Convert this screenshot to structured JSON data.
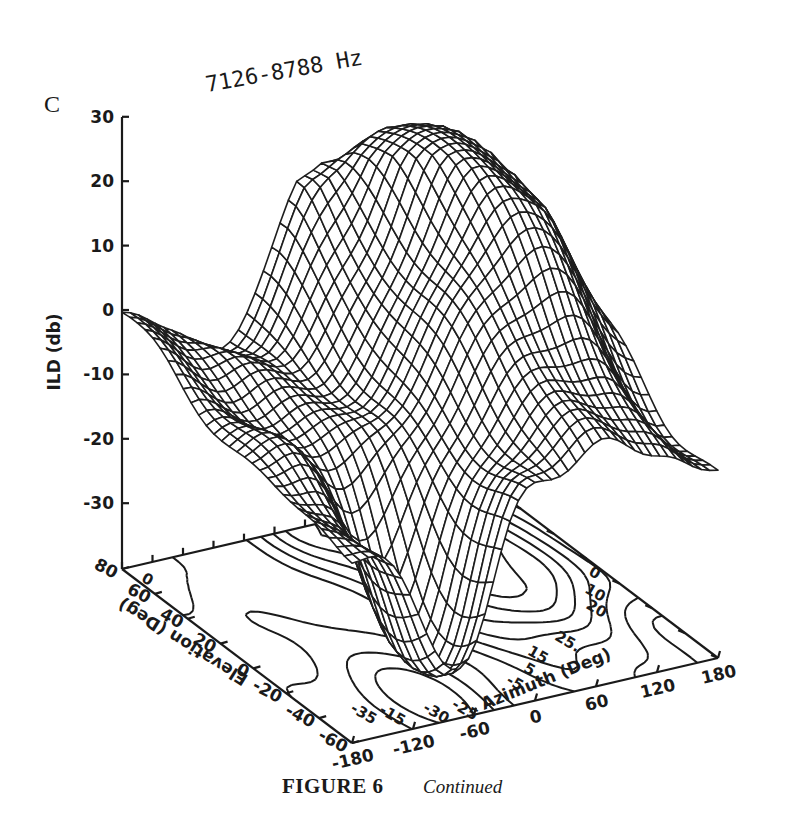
{
  "figure": {
    "panel_letter": "C",
    "caption_label": "FIGURE 6",
    "caption_text": "Continued"
  },
  "chart_data": {
    "type": "surface3d",
    "title": "7126-8788 Hz",
    "zlabel": "ILD (db)",
    "xlabel": "Azimuth (Deg)",
    "ylabel": "Elevation (Deg)",
    "zlim": [
      -38,
      30
    ],
    "xlim": [
      -180,
      180
    ],
    "ylim": [
      -60,
      80
    ],
    "z_ticks": [
      "30",
      "20",
      "10",
      "0",
      "-10",
      "-20",
      "-30"
    ],
    "z_tick_values": [
      30,
      20,
      10,
      0,
      -10,
      -20,
      -30
    ],
    "x_ticks": [
      "-180",
      "-120",
      "-60",
      "0",
      "60",
      "120",
      "180"
    ],
    "x_tick_values": [
      -180,
      -120,
      -60,
      0,
      60,
      120,
      180
    ],
    "y_ticks": [
      "80",
      "60",
      "40",
      "20",
      "0",
      "-20",
      "-40",
      "-60"
    ],
    "y_tick_values": [
      80,
      60,
      40,
      20,
      0,
      -20,
      -40,
      -60
    ],
    "grid": false,
    "base_contour_plot": true,
    "contour_labels": [
      {
        "text": "0",
        "azimuth": -178,
        "elevation": 70
      },
      {
        "text": "-30",
        "azimuth": -95,
        "elevation": -50
      },
      {
        "text": "-25",
        "azimuth": -70,
        "elevation": -52
      },
      {
        "text": "-35",
        "azimuth": -150,
        "elevation": -40
      },
      {
        "text": "-15",
        "azimuth": -130,
        "elevation": -45
      },
      {
        "text": "-5",
        "azimuth": -5,
        "elevation": -45
      },
      {
        "text": "5",
        "azimuth": 20,
        "elevation": -40
      },
      {
        "text": "15",
        "azimuth": 40,
        "elevation": -30
      },
      {
        "text": "25.",
        "azimuth": 75,
        "elevation": -25
      },
      {
        "text": "20",
        "azimuth": 130,
        "elevation": -10
      },
      {
        "text": "10",
        "azimuth": 145,
        "elevation": 0
      },
      {
        "text": "0",
        "azimuth": 165,
        "elevation": 10
      }
    ],
    "surface_description": "ILD rises from about -38 dB near azimuth -60..-90 at low elevations to a broad maximum of about +22 to +27 dB near azimuth +60..+100 at elevations 0..60; falls to about 0 dB at azimuth -180 / elevation 80 and to about -10 dB at azimuth +180 / elevation -60.",
    "surface_key_points": [
      {
        "azimuth": -180,
        "elevation": 80,
        "ild": 0
      },
      {
        "azimuth": -180,
        "elevation": -60,
        "ild": -15
      },
      {
        "azimuth": -80,
        "elevation": -40,
        "ild": -37
      },
      {
        "azimuth": 0,
        "elevation": 80,
        "ild": 22
      },
      {
        "azimuth": 60,
        "elevation": 60,
        "ild": 24
      },
      {
        "azimuth": 90,
        "elevation": 40,
        "ild": 27
      },
      {
        "azimuth": 120,
        "elevation": 20,
        "ild": 20
      },
      {
        "azimuth": 180,
        "elevation": -60,
        "ild": -10
      }
    ]
  }
}
